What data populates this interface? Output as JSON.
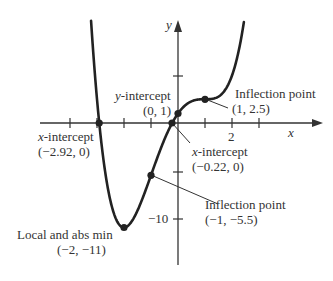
{
  "chart_data": {
    "type": "line",
    "title": "",
    "function": "f(x) = x^4/2 - 3x^2 + 4x + 1",
    "xlabel": "x",
    "ylabel": "y",
    "xlim": [
      -4,
      4
    ],
    "ylim": [
      -15,
      11
    ],
    "grid": false,
    "x_ticks": [
      -4,
      -3,
      -2,
      -1,
      1,
      2,
      3
    ],
    "x_tick_labels": [
      {
        "value": 2,
        "label": "2"
      }
    ],
    "y_ticks": [
      5,
      -5,
      -10
    ],
    "y_tick_labels": [
      {
        "value": -10,
        "label": "−10"
      }
    ],
    "series": [
      {
        "name": "f(x)",
        "x": [
          -3.2,
          -3,
          -2.92,
          -2.5,
          -2,
          -1.5,
          -1,
          -0.5,
          -0.22,
          0,
          0.5,
          1,
          1.5,
          2,
          2.45
        ],
        "y": [
          10.5,
          5.5,
          0,
          -8.7,
          -11,
          -9.2,
          -5.5,
          -1.72,
          0,
          1,
          2.28,
          2.5,
          3.78,
          9,
          16.2
        ]
      }
    ],
    "annotations": [
      {
        "id": "y_intercept",
        "title": "y-intercept",
        "coords": "(0, 1)",
        "x": 0,
        "y": 1
      },
      {
        "id": "inflection_1",
        "title": "Inflection point",
        "coords": "(1, 2.5)",
        "x": 1,
        "y": 2.5
      },
      {
        "id": "x_intercept_left",
        "title": "x-intercept",
        "coords": "(−2.92, 0)",
        "x": -2.92,
        "y": 0
      },
      {
        "id": "x_intercept_right",
        "title": "x-intercept",
        "coords": "(−0.22, 0)",
        "x": -0.22,
        "y": 0
      },
      {
        "id": "inflection_2",
        "title": "Inflection point",
        "coords": "(−1, −5.5)",
        "x": -1,
        "y": -5.5
      },
      {
        "id": "minimum",
        "title": "Local and abs min",
        "coords": "(−2, −11)",
        "x": -2,
        "y": -11
      }
    ]
  },
  "labels": {
    "x_axis": "x",
    "y_axis": "y",
    "tick_x2": "2",
    "tick_y_neg10": "−10",
    "y_int_title_prefix": "y",
    "y_int_title_rest": "-intercept",
    "y_int_coords": "(0, 1)",
    "infl1_title": "Inflection point",
    "infl1_coords": "(1, 2.5)",
    "xint_left_prefix": "x",
    "xint_left_rest": "-intercept",
    "xint_left_coords": "(−2.92, 0)",
    "xint_right_prefix": "x",
    "xint_right_rest": "-intercept",
    "xint_right_coords": "(−0.22, 0)",
    "infl2_title": "Inflection point",
    "infl2_coords": "(−1, −5.5)",
    "min_title": "Local and abs min",
    "min_coords": "(−2, −11)"
  },
  "colors": {
    "curve": "#222222",
    "axis": "#333333",
    "text": "#333333"
  }
}
